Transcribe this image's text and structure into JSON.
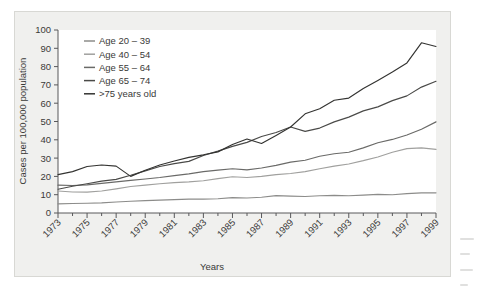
{
  "chart_data": {
    "type": "line",
    "title": "",
    "xlabel": "Years",
    "ylabel": "Cases per 100,000 population",
    "xlim": [
      1973,
      1999
    ],
    "ylim": [
      0,
      100
    ],
    "grid": false,
    "legend_position": "top-left",
    "x": [
      1973,
      1974,
      1975,
      1976,
      1977,
      1978,
      1979,
      1980,
      1981,
      1982,
      1983,
      1984,
      1985,
      1986,
      1987,
      1988,
      1989,
      1990,
      1991,
      1992,
      1993,
      1994,
      1995,
      1996,
      1997,
      1998,
      1999
    ],
    "xticks": [
      1973,
      1975,
      1977,
      1979,
      1981,
      1983,
      1985,
      1987,
      1989,
      1991,
      1993,
      1995,
      1997,
      1999
    ],
    "xtick_labels": [
      "1973",
      "1975",
      "1977",
      "1979",
      "1981",
      "1983",
      "1985",
      "1987",
      "1989",
      "1991",
      "1993",
      "1995",
      "1997",
      "1999"
    ],
    "yticks": [
      0,
      10,
      20,
      30,
      40,
      50,
      60,
      70,
      80,
      90,
      100
    ],
    "ytick_labels": [
      "0",
      "10",
      "20",
      "30",
      "40",
      "50",
      "60",
      "70",
      "80",
      "90",
      "100"
    ],
    "series": [
      {
        "name": "Age 20 – 39",
        "color": "#8c8c8a",
        "values": [
          5.0,
          5.2,
          5.3,
          5.5,
          6.0,
          6.4,
          6.8,
          7.0,
          7.3,
          7.6,
          7.6,
          7.8,
          8.4,
          8.2,
          8.6,
          9.5,
          9.2,
          9.0,
          9.4,
          9.6,
          9.4,
          9.8,
          10.2,
          10.0,
          10.6,
          11.0,
          11.0
        ]
      },
      {
        "name": "Age 40 – 54",
        "color": "#a0a09e",
        "values": [
          12.0,
          11.5,
          11.4,
          12.0,
          13.2,
          14.5,
          15.2,
          16.0,
          16.6,
          17.0,
          17.6,
          18.8,
          19.8,
          19.4,
          20.0,
          21.0,
          21.6,
          22.6,
          24.2,
          25.6,
          26.8,
          28.6,
          30.6,
          33.2,
          35.2,
          35.6,
          34.8
        ]
      },
      {
        "name": "Age 55 – 64",
        "color": "#6a6a68",
        "values": [
          15.2,
          15.0,
          15.4,
          16.2,
          17.0,
          17.8,
          18.6,
          19.4,
          20.4,
          21.4,
          22.6,
          23.4,
          24.2,
          23.6,
          24.6,
          26.0,
          27.8,
          28.8,
          31.0,
          32.4,
          33.2,
          35.6,
          38.4,
          40.2,
          42.6,
          45.8,
          49.8
        ]
      },
      {
        "name": "Age 65 – 74",
        "color": "#4a4a48",
        "values": [
          13.0,
          14.6,
          16.0,
          17.4,
          18.4,
          20.6,
          23.0,
          25.4,
          27.0,
          28.2,
          31.4,
          33.8,
          36.4,
          38.6,
          41.8,
          44.0,
          47.0,
          44.6,
          46.4,
          49.8,
          52.4,
          55.8,
          58.0,
          61.4,
          64.0,
          68.8,
          72.0
        ]
      },
      {
        "name": ">75 years old",
        "color": "#333331",
        "values": [
          21.0,
          22.6,
          25.4,
          26.2,
          25.6,
          20.0,
          23.4,
          26.2,
          28.4,
          30.4,
          31.8,
          33.4,
          37.4,
          40.4,
          38.0,
          42.4,
          47.0,
          54.2,
          57.0,
          61.6,
          62.8,
          68.0,
          72.4,
          77.0,
          82.0,
          93.0,
          91.0
        ]
      }
    ]
  },
  "legend": {
    "items": [
      {
        "label": "Age 20 – 39"
      },
      {
        "label": "Age 40 – 54"
      },
      {
        "label": "Age 55 – 64"
      },
      {
        "label": "Age 65 – 74"
      },
      {
        "label": ">75 years old"
      }
    ]
  },
  "axes": {
    "y_title": "Cases per 100,000 population",
    "x_title": "Years"
  }
}
